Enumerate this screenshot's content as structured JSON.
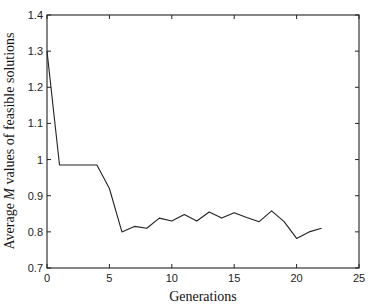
{
  "chart_data": {
    "type": "line",
    "title": "",
    "xlabel": "Generations",
    "ylabel": "Average M values of feasible solutions",
    "ylabel_parts": {
      "prefix": "Average ",
      "italic": "M",
      "suffix": " values of feasible solutions"
    },
    "xlim": [
      0,
      25
    ],
    "ylim": [
      0.7,
      1.4
    ],
    "xticks": [
      0,
      5,
      10,
      15,
      20,
      25
    ],
    "xtick_labels": [
      "0",
      "5",
      "10",
      "15",
      "20",
      "25"
    ],
    "yticks": [
      0.7,
      0.8,
      0.9,
      1.0,
      1.1,
      1.2,
      1.3,
      1.4
    ],
    "ytick_labels": [
      "0.7",
      "0.8",
      "0.9",
      "1",
      "1.1",
      "1.2",
      "1.3",
      "1.4"
    ],
    "grid": false,
    "legend": null,
    "series": [
      {
        "name": "Average M",
        "color": "#222222",
        "x": [
          0,
          1,
          2,
          3,
          4,
          5,
          6,
          7,
          8,
          9,
          10,
          11,
          12,
          13,
          14,
          15,
          16,
          17,
          18,
          19,
          20,
          21,
          22
        ],
        "values": [
          1.3,
          0.985,
          0.985,
          0.985,
          0.985,
          0.92,
          0.8,
          0.815,
          0.81,
          0.838,
          0.83,
          0.848,
          0.83,
          0.855,
          0.838,
          0.853,
          0.84,
          0.828,
          0.858,
          0.828,
          0.782,
          0.8,
          0.81
        ]
      }
    ]
  },
  "layout": {
    "plot_left": 47,
    "plot_right": 359,
    "plot_top": 15,
    "plot_bottom": 268
  }
}
